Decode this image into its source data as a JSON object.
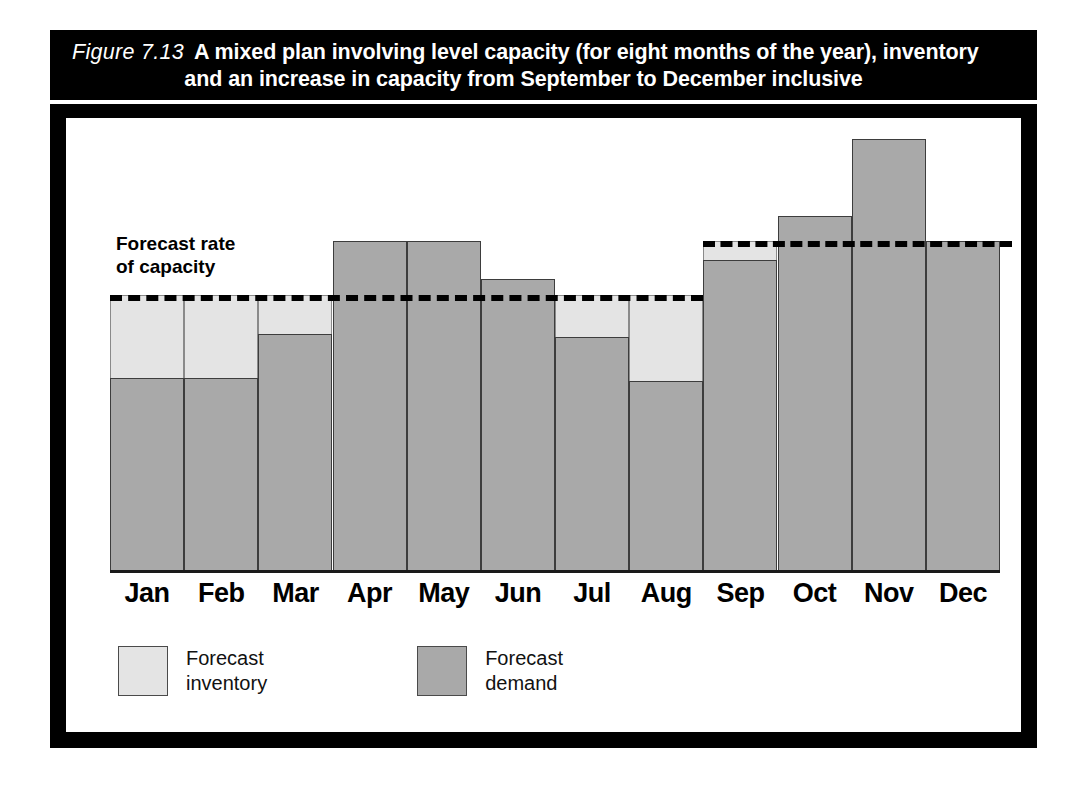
{
  "figure": {
    "number": "Figure 7.13",
    "title_line1": "A mixed plan involving level capacity (for eight months of the year), inventory",
    "title_line2": "and an increase in capacity from September to December inclusive"
  },
  "annotations": {
    "capacity_label": "Forecast rate\nof capacity",
    "capacity_label_line1": "Forecast rate",
    "capacity_label_line2": "of capacity"
  },
  "legend": {
    "position": "bottom-left",
    "items": [
      {
        "label": "Forecast\ninventory",
        "label_line1": "Forecast",
        "label_line2": "inventory",
        "color": "#e4e4e4",
        "swatch": "inventory"
      },
      {
        "label": "Forecast\ndemand",
        "label_line1": "Forecast",
        "label_line2": "demand",
        "color": "#a9a9a9",
        "swatch": "demand"
      }
    ]
  },
  "colors": {
    "frame": "#000000",
    "title_bar_bg": "#000000",
    "title_bar_text": "#ffffff",
    "inventory_fill": "#e4e4e4",
    "demand_fill": "#a9a9a9",
    "bar_outline": "#3d3d3d",
    "capacity_line": "#000000",
    "background": "#ffffff"
  },
  "chart_data": {
    "type": "bar",
    "title": "A mixed plan involving level capacity (for eight months of the year), inventory and an increase in capacity from September to December inclusive",
    "xlabel": "",
    "ylabel": "",
    "grid": false,
    "ylim": [
      0,
      157
    ],
    "categories": [
      "Jan",
      "Feb",
      "Mar",
      "Apr",
      "May",
      "Jun",
      "Jul",
      "Aug",
      "Sep",
      "Oct",
      "Nov",
      "Dec"
    ],
    "series": [
      {
        "name": "Forecast demand",
        "color": "#a9a9a9",
        "values": [
          70,
          70,
          86,
          120,
          120,
          106,
          85,
          69,
          113,
          129,
          157,
          120
        ]
      },
      {
        "name": "Forecast inventory",
        "color": "#e4e4e4",
        "note": "light shading between top of demand bar and the forecast capacity line, shown only where demand is below capacity",
        "values": [
          30,
          30,
          14,
          0,
          0,
          0,
          15,
          31,
          7,
          0,
          0,
          0
        ]
      }
    ],
    "capacity": {
      "label": "Forecast rate of capacity",
      "style": "dashed",
      "segments": [
        {
          "name": "level-capacity-jan-aug",
          "months": [
            "Jan",
            "Feb",
            "Mar",
            "Apr",
            "May",
            "Jun",
            "Jul",
            "Aug"
          ],
          "value": 100
        },
        {
          "name": "increased-capacity-sep-dec",
          "months": [
            "Sep",
            "Oct",
            "Nov",
            "Dec"
          ],
          "value": 120
        }
      ]
    }
  }
}
